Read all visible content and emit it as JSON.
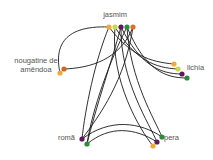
{
  "diagram": {
    "type": "chord-network",
    "background": "#ffffff",
    "edge_color": "#1a1a1a",
    "nodes": [
      {
        "id": "jasmim",
        "label": "jasmim",
        "label_x": 115,
        "label_y": 17,
        "anchor": "middle",
        "ports": [
          {
            "x": 109,
            "y": 27,
            "color": "#f2a93b"
          },
          {
            "x": 115,
            "y": 27,
            "color": "#c5d94a"
          },
          {
            "x": 121,
            "y": 27,
            "color": "#5e1a5a"
          },
          {
            "x": 127,
            "y": 27,
            "color": "#2e8b3a"
          },
          {
            "x": 133,
            "y": 27,
            "color": "#d9732a"
          }
        ]
      },
      {
        "id": "nougatine",
        "label_lines": [
          "nougatine de",
          "amêndoa"
        ],
        "label_x": 36,
        "label_y": 63,
        "anchor": "middle",
        "ports": [
          {
            "x": 64,
            "y": 69,
            "color": "#c86a25"
          },
          {
            "x": 60,
            "y": 73,
            "color": "#f2a93b"
          }
        ]
      },
      {
        "id": "lichia",
        "label": "lichia",
        "label_x": 187,
        "label_y": 70,
        "anchor": "start",
        "ports": [
          {
            "x": 174,
            "y": 64,
            "color": "#f2a93b"
          },
          {
            "x": 178,
            "y": 69,
            "color": "#c5d94a"
          },
          {
            "x": 182,
            "y": 74,
            "color": "#5e1a5a"
          },
          {
            "x": 187,
            "y": 78,
            "color": "#2e8b3a"
          }
        ]
      },
      {
        "id": "roma",
        "label": "romã",
        "label_x": 75,
        "label_y": 140,
        "anchor": "end",
        "ports": [
          {
            "x": 82,
            "y": 139,
            "color": "#5e1a5a"
          },
          {
            "x": 87,
            "y": 144,
            "color": "#2e8b3a"
          }
        ]
      },
      {
        "id": "pera",
        "label": "pera",
        "label_x": 164,
        "label_y": 140,
        "anchor": "start",
        "ports": [
          {
            "x": 162,
            "y": 137,
            "color": "#2e8b3a"
          },
          {
            "x": 157,
            "y": 142,
            "color": "#5e1a5a"
          },
          {
            "x": 153,
            "y": 146,
            "color": "#f2a93b"
          }
        ]
      }
    ],
    "edges": [
      {
        "d": "M109,27 C60,25 55,50 60,73"
      },
      {
        "d": "M133,27 C120,60 90,68 64,69"
      },
      {
        "d": "M109,27 C95,60 85,110 82,139"
      },
      {
        "d": "M127,27 C110,60 92,110 87,144"
      },
      {
        "d": "M115,27 C110,80 140,130 153,146"
      },
      {
        "d": "M121,27 C120,80 150,125 157,142"
      },
      {
        "d": "M127,27 C130,80 155,120 162,137"
      },
      {
        "d": "M109,27 C130,55 150,62 174,64"
      },
      {
        "d": "M115,27 C135,60 155,68 178,69"
      },
      {
        "d": "M121,27 C140,65 160,74 182,74"
      },
      {
        "d": "M127,27 C145,70 165,78 187,78"
      },
      {
        "d": "M82,139 C110,118 140,122 162,137"
      },
      {
        "d": "M87,144 C110,125 135,128 157,142"
      },
      {
        "d": "M133,27 C125,80 100,115 82,139"
      },
      {
        "d": "M121,27 C112,60 95,110 87,144"
      }
    ]
  }
}
